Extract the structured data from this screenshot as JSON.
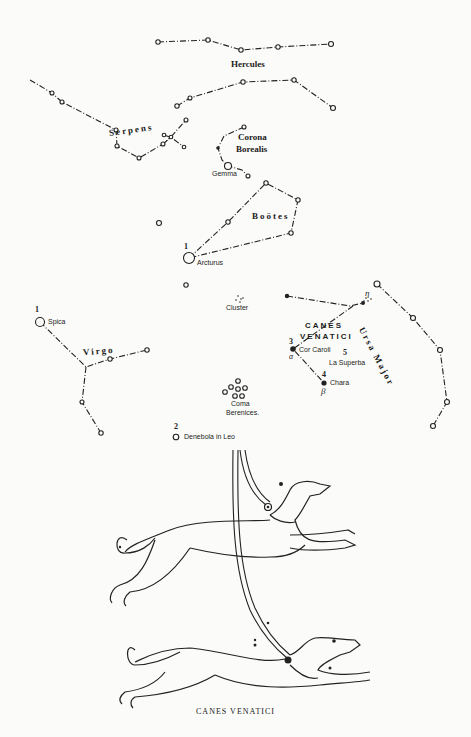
{
  "caption": "CANES VENATICI",
  "constellations": {
    "hercules": "Hercules",
    "serpens": "Serpens",
    "corona_line1": "Corona",
    "corona_line2": "Borealis",
    "bootes": "Boötes",
    "virgo": "Virgo",
    "canes_line1": "CANES",
    "canes_line2": "VENATICI",
    "ursa_major": "Ursa Major",
    "coma_line1": "Coma",
    "coma_line2": "Berenices."
  },
  "stars": {
    "gemma": "Gemma",
    "arcturus": "Arcturus",
    "arcturus_mag": "1",
    "spica": "Spica",
    "spica_mag": "1",
    "cluster": "Cluster",
    "cor_caroli": "Cor Caroli",
    "cor_caroli_mag": "3",
    "cor_caroli_greek": "α",
    "la_superba": "La Superba",
    "la_superba_mag": "5",
    "chara": "Chara",
    "chara_mag": "4",
    "chara_greek": "β",
    "eta": "η",
    "denebola": "Denebola in Leo",
    "denebola_mag": "2"
  },
  "colors": {
    "ink": "#1c1c1c",
    "paper": "#fbfbf9"
  }
}
